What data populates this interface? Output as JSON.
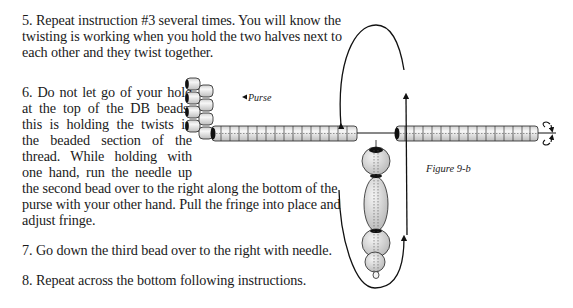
{
  "instructions": [
    {
      "number": "5.",
      "lines": [
        "5.  Repeat instruction #3 several times.  You will know the",
        "twisting is working when you hold the two halves next to",
        "each other and they twist together."
      ]
    },
    {
      "number": "6.",
      "lines": [
        "6.  Do not let go of your hold",
        "at the top of the DB beads,",
        "this is holding the twists in",
        "the beaded section of the",
        "thread.  While holding with",
        "one hand, run the needle up",
        "the second bead over to the right along the bottom of the",
        "purse with your other hand.  Pull the fringe into place and",
        "adjust fringe."
      ]
    },
    {
      "number": "7.",
      "lines": [
        "7.  Go down the third bead over to the right with needle."
      ]
    },
    {
      "number": "8.",
      "lines": [
        "8.  Repeat across the bottom following instructions."
      ]
    }
  ],
  "figure": {
    "caption": "Figure 9-b",
    "purse_label": "Purse",
    "left_strand_beads": 16,
    "right_strand_beads": 16,
    "purse_rows": 4,
    "colors": {
      "ink": "#111111",
      "bead_fill": "#e6e6e6",
      "bead_shadow": "#b5b5b5"
    }
  }
}
